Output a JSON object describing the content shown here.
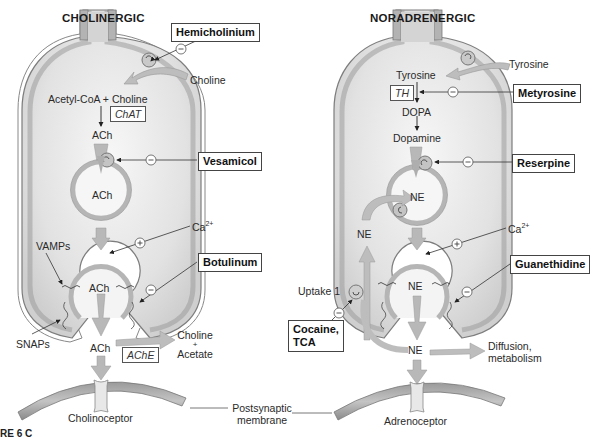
{
  "figure": {
    "left_panel": {
      "title": "CHOLINERGIC",
      "transported_in": "Choline",
      "synthesis": "Acetyl-CoA + Choline",
      "enzyme_synthesis": "ChAT",
      "product": "ACh",
      "vesicle_content": "ACh",
      "release_vesicle_content": "ACh",
      "calcium": "Ca",
      "calcium_sup": "2+",
      "vamps_label": "VAMPs",
      "snaps_label": "SNAPs",
      "cleft_transmitter": "ACh",
      "degradation_enzyme": "AChE",
      "degradation_products_1": "Choline",
      "degradation_products_plus": "+",
      "degradation_products_2": "Acetate",
      "receptor_label": "Cholinoceptor",
      "drugs": [
        {
          "name": "Hemicholinium",
          "effect": "−",
          "target": "choline transporter"
        },
        {
          "name": "Vesamicol",
          "effect": "−",
          "target": "vesicular transporter"
        },
        {
          "name": "Botulinum",
          "effect": "−",
          "target": "vesicle release"
        }
      ],
      "calcium_effect": "+"
    },
    "right_panel": {
      "title": "NORADRENERGIC",
      "transported_in": "Tyrosine",
      "precursor": "Tyrosine",
      "enzyme_synthesis": "TH",
      "intermediate": "DOPA",
      "product": "Dopamine",
      "vesicle_content": "NE",
      "reuptake_ne": "NE",
      "release_vesicle_content": "NE",
      "calcium": "Ca",
      "calcium_sup": "2+",
      "uptake_label": "Uptake 1",
      "cleft_transmitter": "NE",
      "fate_1": "Diffusion,",
      "fate_2": "metabolism",
      "receptor_label": "Adrenoceptor",
      "drugs": [
        {
          "name": "Metyrosine",
          "effect": "−",
          "target": "tyrosine hydroxylase"
        },
        {
          "name": "Reserpine",
          "effect": "−",
          "target": "vesicular transporter"
        },
        {
          "name": "Guanethidine",
          "effect": "−",
          "target": "vesicle release"
        },
        {
          "name_line1": "Cocaine,",
          "name_line2": "TCA",
          "effect": "−",
          "target": "Uptake 1"
        }
      ],
      "calcium_effect": "+"
    },
    "shared": {
      "postsynaptic_1": "Postsynaptic",
      "postsynaptic_2": "membrane"
    },
    "caption": "RE 6  C"
  },
  "colors": {
    "membrane": "#a9a9a9",
    "membrane_dark": "#7d7d7d",
    "cytoplasm": "#e4e4e4",
    "arrow_fill": "#b9b9b9",
    "text": "#2a2a2a"
  }
}
